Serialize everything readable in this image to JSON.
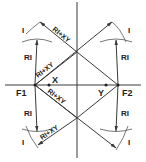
{
  "diagram": {
    "labels": {
      "f1": "F1",
      "f2": "F2",
      "x": "X",
      "y": "Y",
      "ri": "RI",
      "i": "I",
      "ri_plus_xy": "RI+XY"
    },
    "colors": {
      "line": "#3a3a3a",
      "text": "#222222",
      "background": "#ffffff"
    }
  }
}
